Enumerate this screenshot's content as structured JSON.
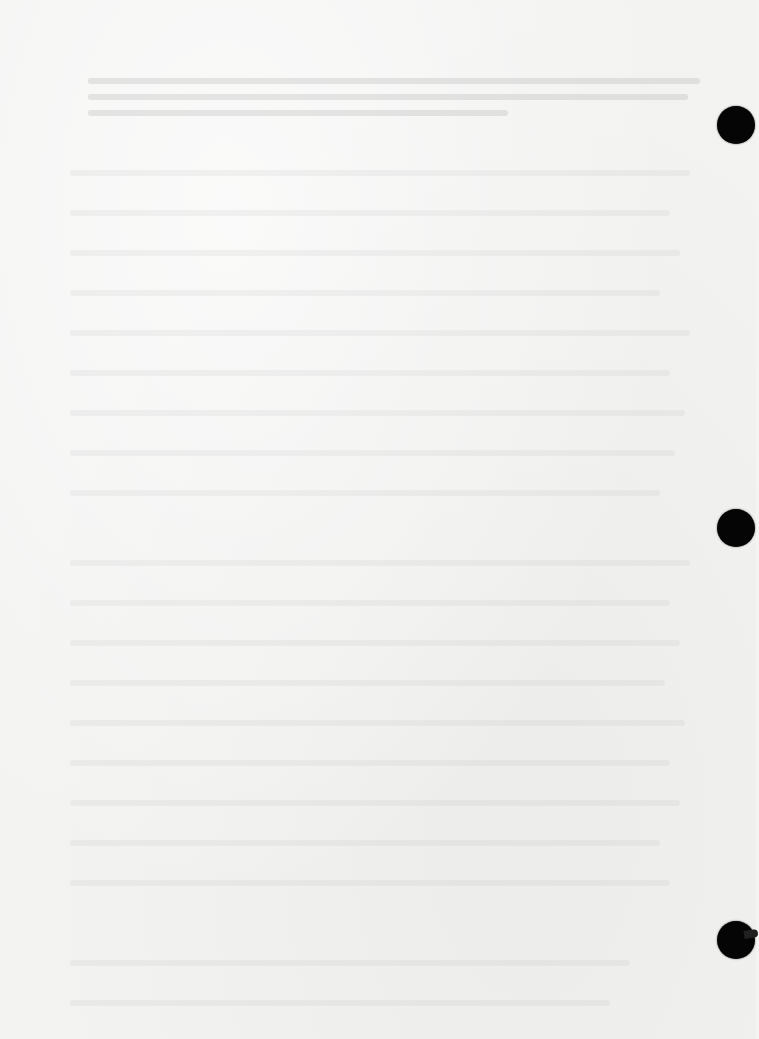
{
  "document": {
    "type": "scanned blank / faded binder page",
    "text_lines": [],
    "legible_text": ""
  },
  "binder_holes": [
    {
      "position": "top",
      "x": 736,
      "y": 125
    },
    {
      "position": "middle",
      "x": 736,
      "y": 528
    },
    {
      "position": "bottom",
      "x": 736,
      "y": 940
    }
  ],
  "colors": {
    "paper": "#f3f3f2",
    "hole": "#050505"
  }
}
